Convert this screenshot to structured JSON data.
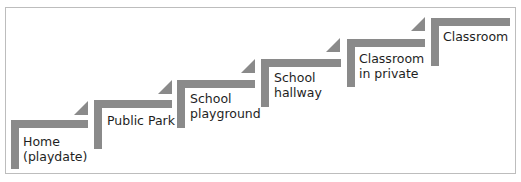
{
  "diagram": {
    "type": "staircase",
    "color": "#8a8a8a",
    "steps": [
      {
        "label_line1": "Home",
        "label_line2": "(playdate)"
      },
      {
        "label_line1": "Public Park",
        "label_line2": ""
      },
      {
        "label_line1": "School",
        "label_line2": "playground"
      },
      {
        "label_line1": "School",
        "label_line2": "hallway"
      },
      {
        "label_line1": "Classroom",
        "label_line2": "in private"
      },
      {
        "label_line1": "Classroom",
        "label_line2": ""
      }
    ]
  }
}
